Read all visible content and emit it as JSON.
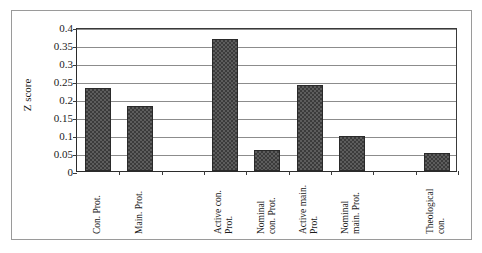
{
  "chart_data": {
    "type": "bar",
    "title": "",
    "xlabel": "",
    "ylabel": "Z score",
    "ylim": [
      0,
      0.4
    ],
    "ytick_labels": [
      "0.4",
      "0.35",
      "0.3",
      "0.25",
      "0.2",
      "0.15",
      "0.1",
      "0.05",
      "0"
    ],
    "ytick_values": [
      0.4,
      0.35,
      0.3,
      0.25,
      0.2,
      0.15,
      0.1,
      0.05,
      0
    ],
    "grid": true,
    "legend": "none",
    "bar_fill": "#5d5d5d",
    "bar_pattern": "checkered-hatch",
    "bar_border": "#2a2a2a",
    "categories": [
      "Con. Prot.",
      "Main. Prot.",
      "",
      "Active con. Prot.",
      "Nominal con. Prot.",
      "Active main. Prot.",
      "Nominal main. Prot.",
      "",
      "Theological con."
    ],
    "category_label_lines": [
      [
        "Con. Prot."
      ],
      [
        "Main. Prot."
      ],
      [
        ""
      ],
      [
        "Active con.",
        "Prot."
      ],
      [
        "Nominal",
        "con. Prot."
      ],
      [
        "Active main.",
        "Prot."
      ],
      [
        "Nominal",
        "main. Prot."
      ],
      [
        ""
      ],
      [
        "Theological",
        "con."
      ]
    ],
    "values": [
      0.23,
      0.18,
      null,
      0.368,
      0.058,
      0.238,
      0.098,
      null,
      0.049
    ]
  }
}
